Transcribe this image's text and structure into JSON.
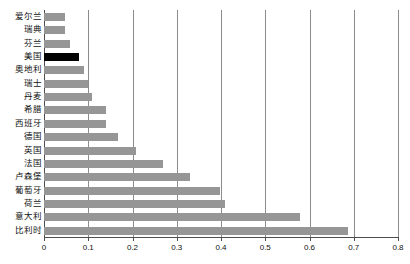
{
  "chart_data": {
    "type": "bar",
    "orientation": "horizontal",
    "title": "",
    "xlabel": "",
    "ylabel": "",
    "xlim": [
      0,
      0.8
    ],
    "xticks": [
      "0",
      "0.1",
      "0.2",
      "0.3",
      "0.4",
      "0.5",
      "0.6",
      "0.7",
      "0.8"
    ],
    "xtick_values": [
      0,
      0.1,
      0.2,
      0.3,
      0.4,
      0.5,
      0.6,
      0.7,
      0.8
    ],
    "grid": "vertical",
    "legend": "none",
    "categories": [
      "爱尔兰",
      "瑞典",
      "芬兰",
      "美国",
      "奥地利",
      "瑞士",
      "丹麦",
      "希腊",
      "西班牙",
      "德国",
      "英国",
      "法国",
      "卢森堡",
      "葡萄牙",
      "荷兰",
      "意大利",
      "比利时"
    ],
    "values": [
      0.048,
      0.047,
      0.058,
      0.079,
      0.09,
      0.1,
      0.108,
      0.139,
      0.139,
      0.168,
      0.208,
      0.268,
      0.329,
      0.397,
      0.408,
      0.578,
      0.688
    ],
    "highlight_category": "美国",
    "colors": {
      "bar": "#969696",
      "highlight_bar": "#000000",
      "gridline": "#8c8c8c",
      "axis": "#4d4d4d",
      "background": "#ffffff",
      "text": "#111111"
    }
  }
}
